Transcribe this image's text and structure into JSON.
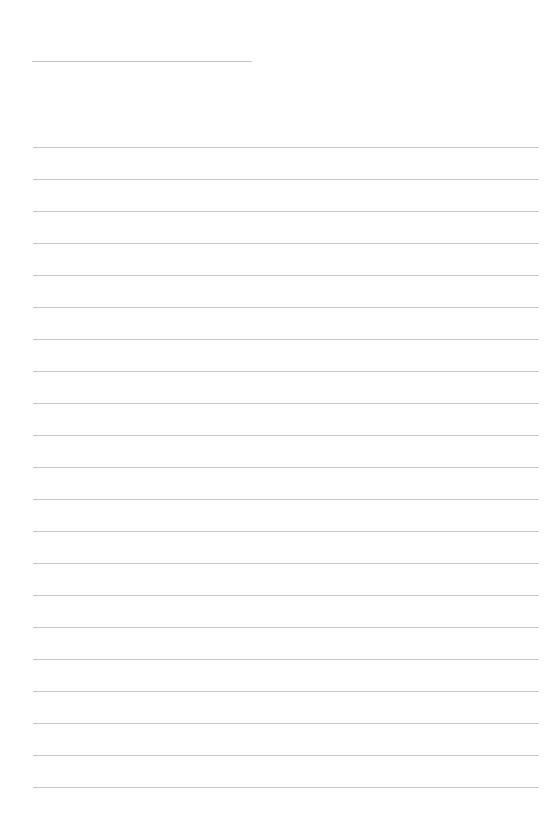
{
  "page": {
    "type": "lined-paper",
    "background_color": "#ffffff",
    "line_color": "#c8c8c8",
    "title_line": {
      "present": true
    },
    "ruled_lines": {
      "count": 21
    }
  }
}
